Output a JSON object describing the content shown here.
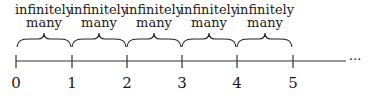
{
  "diagram": {
    "type": "number-line",
    "interval_label_line1": "infinitely",
    "interval_label_line2": "many",
    "intervals": [
      {
        "from": 0,
        "to": 1,
        "line1": "infinitely",
        "line2": "many"
      },
      {
        "from": 1,
        "to": 2,
        "line1": "infinitely",
        "line2": "many"
      },
      {
        "from": 2,
        "to": 3,
        "line1": "infinitely",
        "line2": "many"
      },
      {
        "from": 3,
        "to": 4,
        "line1": "infinitely",
        "line2": "many"
      },
      {
        "from": 4,
        "to": 5,
        "line1": "infinitely",
        "line2": "many"
      }
    ],
    "ticks": [
      "0",
      "1",
      "2",
      "3",
      "4",
      "5"
    ],
    "continuation": "···",
    "line_color": "#333333"
  }
}
